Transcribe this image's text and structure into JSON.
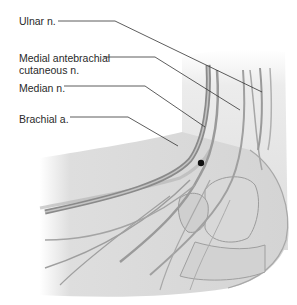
{
  "figure": {
    "labels": [
      {
        "id": "ulnar",
        "text": "Ulnar n.",
        "x": 19,
        "y": 15
      },
      {
        "id": "medial-antebrachial",
        "line1": "Medial antebrachial",
        "line2": "cutaneous n.",
        "x": 19,
        "y": 52
      },
      {
        "id": "median",
        "text": "Median n.",
        "x": 19,
        "y": 82
      },
      {
        "id": "brachial",
        "text": "Brachial a.",
        "x": 19,
        "y": 113
      }
    ],
    "colors": {
      "skin": "#e2e2e2",
      "skin_shadow": "#bdbdbd",
      "vessel": "#8a8a8a",
      "leader_line": "#333333",
      "text": "#2a2a2a"
    },
    "marker": {
      "name": "reference-dot",
      "x": 201,
      "y": 163
    }
  }
}
